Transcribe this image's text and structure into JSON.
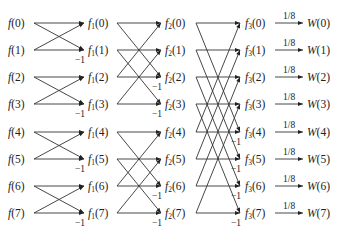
{
  "rows_y": [
    23,
    50,
    77,
    104,
    132,
    159,
    186,
    213
  ],
  "columns": [
    {
      "name": "input",
      "prefix": "f",
      "sub": "",
      "label_x": 8,
      "out_x": 34,
      "in_x": null
    },
    {
      "name": "stage1",
      "prefix": "f",
      "sub": "1",
      "label_x": 88,
      "in_x": 84,
      "out_x": 117
    },
    {
      "name": "stage2",
      "prefix": "f",
      "sub": "2",
      "label_x": 165,
      "in_x": 161,
      "out_x": 196
    },
    {
      "name": "stage3",
      "prefix": "f",
      "sub": "3",
      "label_x": 245,
      "in_x": 240,
      "out_x": 275
    },
    {
      "name": "output",
      "prefix": "W",
      "sub": "",
      "label_x": 307,
      "in_x": 303,
      "out_x": null
    }
  ],
  "indices": [
    "0",
    "1",
    "2",
    "3",
    "4",
    "5",
    "6",
    "7"
  ],
  "stages": [
    {
      "span": 1,
      "neg_label": "−1"
    },
    {
      "span": 2,
      "neg_label": "−1"
    },
    {
      "span": 4,
      "neg_label": "−1"
    }
  ],
  "output_weight": "1/8",
  "colors": {
    "line": "#333333",
    "text": "#222222",
    "background": "#ffffff"
  }
}
